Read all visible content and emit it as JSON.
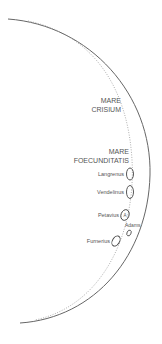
{
  "diagram": {
    "colors": {
      "limb": "#666666",
      "terminator": "#999999",
      "crater": "#444444",
      "text": "#555555"
    },
    "maria": [
      {
        "line1": "MARE",
        "line2": "CRISIUM"
      },
      {
        "line1": "MARE",
        "line2": "FOECUNDITATIS"
      }
    ],
    "craters": [
      {
        "name": "Langrenus"
      },
      {
        "name": "Vendelinus"
      },
      {
        "name": "Petavius",
        "marker": "A"
      },
      {
        "name": "Adams"
      },
      {
        "name": "Furnerius"
      }
    ]
  }
}
